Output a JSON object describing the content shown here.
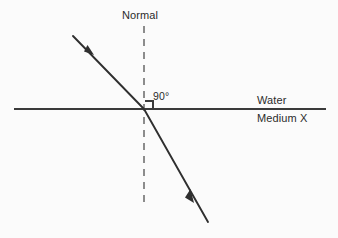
{
  "diagram": {
    "background_color": "#fbfbfb",
    "line_color": "#3a3a3a",
    "dash_color": "#8c8c8c",
    "text_color": "#2b2b2b",
    "labels": {
      "normal": "Normal",
      "angle": "90°",
      "upper_medium": "Water",
      "lower_medium": "Medium X"
    },
    "geometry": {
      "boundary_line": {
        "x1": 14,
        "y1": 109,
        "x2": 326,
        "y2": 109
      },
      "normal_line": {
        "x1": 144,
        "y1": 26,
        "x2": 144,
        "y2": 208
      },
      "incident_ray": {
        "x1": 73,
        "y1": 36,
        "x2": 144,
        "y2": 109
      },
      "refracted_ray": {
        "x1": 144,
        "y1": 109,
        "x2": 208,
        "y2": 222
      },
      "incident_arrow": {
        "x": 90,
        "y": 51
      },
      "refracted_arrow": {
        "x": 190,
        "y": 196
      },
      "right_angle_marker": {
        "x": 145,
        "y": 101,
        "size": 8
      },
      "intersection_point": {
        "x": 144,
        "y": 109
      }
    }
  }
}
